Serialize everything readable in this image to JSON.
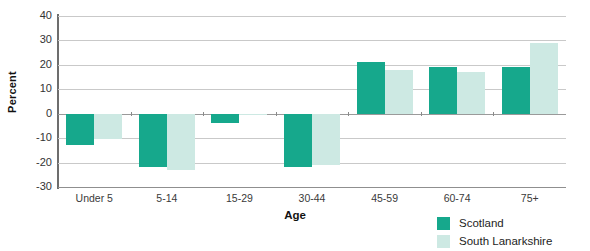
{
  "chart_data": {
    "type": "bar",
    "title": "",
    "xlabel": "Age",
    "ylabel": "Percent",
    "categories": [
      "Under 5",
      "5-14",
      "15-29",
      "30-44",
      "45-59",
      "60-74",
      "75+"
    ],
    "series": [
      {
        "name": "Scotland",
        "color": "#16a88c",
        "values": [
          -13,
          -22,
          -4,
          -22,
          21,
          19,
          19
        ]
      },
      {
        "name": "South Lanarkshire",
        "color": "#cde9e3",
        "values": [
          -10.5,
          -23,
          -0.5,
          -21,
          18,
          17,
          29
        ]
      }
    ],
    "ylim": [
      -30,
      40
    ],
    "yticks": [
      40,
      30,
      20,
      10,
      0,
      -10,
      -20,
      -30
    ],
    "ytick_labels": [
      "40",
      "30",
      "20",
      "10",
      "0",
      "-10",
      "-20",
      "-30"
    ],
    "grid": true,
    "legend_position": "bottom-right",
    "zero_line": 0
  },
  "axis": {
    "y_title": "Percent",
    "x_title": "Age"
  },
  "legend": {
    "items": [
      {
        "label": "Scotland",
        "color": "#16a88c"
      },
      {
        "label": "South Lanarkshire",
        "color": "#cde9e3"
      }
    ]
  }
}
